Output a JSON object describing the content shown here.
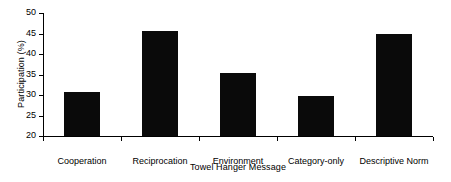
{
  "chart_data": {
    "type": "bar",
    "title": "",
    "xlabel": "Towel Hanger Message",
    "ylabel": "Participation (%)",
    "categories": [
      "Cooperation",
      "Reciprocation",
      "Environment",
      "Category-only",
      "Descriptive Norm"
    ],
    "values": [
      30.8,
      45.5,
      35.4,
      29.8,
      44.8
    ],
    "ylim": [
      20,
      50
    ],
    "yticks": [
      20,
      25,
      30,
      35,
      40,
      45,
      50
    ],
    "ytick_labels": [
      "20",
      "25",
      "30",
      "35",
      "40",
      "45",
      "50"
    ],
    "grid": false,
    "legend": null,
    "bar_color": "#0a0a0a",
    "axis_color": "#000000",
    "background_color": "#ffffff"
  }
}
